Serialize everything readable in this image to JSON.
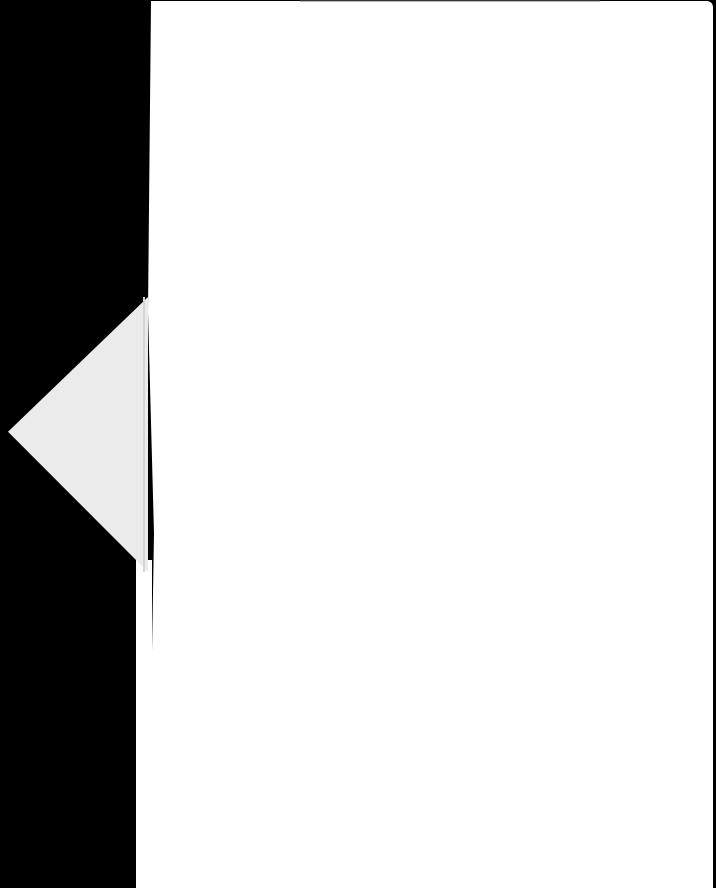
{
  "scene": {
    "description": "Blank white sheet of paper on black background with a folded triangular flap on the left",
    "colors": {
      "background": "#000000",
      "sheet": "#ffffff",
      "flap": "#ebebeb",
      "crease": "#d4d4d4"
    }
  }
}
